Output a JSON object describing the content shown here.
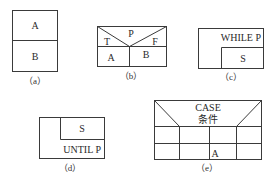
{
  "diagrams": {
    "a": {
      "caption": "（a）",
      "top": "A",
      "bottom": "B"
    },
    "b": {
      "caption": "（b）",
      "condition": "P",
      "true_label": "T",
      "false_label": "F",
      "true_branch": "A",
      "false_branch": "B"
    },
    "c": {
      "caption": "（c）",
      "condition": "WHILE P",
      "body": "S"
    },
    "d": {
      "caption": "（d）",
      "body": "S",
      "condition": "UNTIL P"
    },
    "e": {
      "caption": "（e）",
      "header_line1": "CASE",
      "header_line2": "条件",
      "cell": "A"
    }
  }
}
